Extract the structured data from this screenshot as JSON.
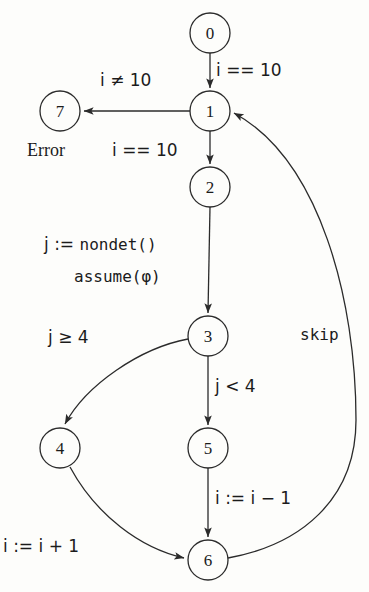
{
  "diagram": {
    "stroke_color": "#2b2b2b",
    "background_color": "#fdfdfb",
    "nodes": [
      {
        "id": "0",
        "label": "0",
        "cx": 210,
        "cy": 33,
        "r": 20
      },
      {
        "id": "1",
        "label": "1",
        "cx": 210,
        "cy": 111,
        "r": 20
      },
      {
        "id": "2",
        "label": "2",
        "cx": 210,
        "cy": 187,
        "r": 20
      },
      {
        "id": "3",
        "label": "3",
        "cx": 208,
        "cy": 336,
        "r": 20
      },
      {
        "id": "4",
        "label": "4",
        "cx": 60,
        "cy": 448,
        "r": 20
      },
      {
        "id": "5",
        "label": "5",
        "cx": 208,
        "cy": 448,
        "r": 20
      },
      {
        "id": "6",
        "label": "6",
        "cx": 208,
        "cy": 560,
        "r": 20
      },
      {
        "id": "7",
        "label": "7",
        "cx": 60,
        "cy": 111,
        "r": 20
      }
    ],
    "edges": [
      {
        "from": "0",
        "to": "1",
        "label": "i == 10"
      },
      {
        "from": "1",
        "to": "7",
        "label": "i ≠ 10"
      },
      {
        "from": "1",
        "to": "2",
        "label": "i == 10"
      },
      {
        "from": "2",
        "to": "3",
        "label": "j := nondet()  assume(φ)"
      },
      {
        "from": "3",
        "to": "4",
        "label": "j ≥ 4"
      },
      {
        "from": "3",
        "to": "5",
        "label": "j < 4"
      },
      {
        "from": "5",
        "to": "6",
        "label": "i := i − 1"
      },
      {
        "from": "4",
        "to": "6",
        "label": "i := i + 1"
      },
      {
        "from": "6",
        "to": "1",
        "label": "skip"
      }
    ],
    "labels": {
      "i_eq_10_top": "i == 10",
      "i_neq_10": "i ≠ 10",
      "error": "Error",
      "i_eq_10_mid": "i == 10",
      "assign_j_prefix": "j :=",
      "assign_j_call": "nondet()",
      "assume_call": "assume(φ)",
      "j_ge_4": "j ≥ 4",
      "j_lt_4": "j < 4",
      "i_dec": "i := i − 1",
      "i_inc": "i := i + 1",
      "skip": "skip"
    }
  }
}
